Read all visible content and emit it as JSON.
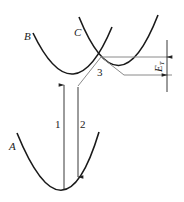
{
  "diagram": {
    "type": "configuration-coordinate",
    "curves": [
      {
        "id": "A",
        "label": "A"
      },
      {
        "id": "B",
        "label": "B"
      },
      {
        "id": "C",
        "label": "C"
      }
    ],
    "transitions": [
      {
        "id": "1",
        "label": "1",
        "direction": "up",
        "from": "A",
        "to": "B"
      },
      {
        "id": "2",
        "label": "2",
        "direction": "down",
        "from": "B",
        "to": "A"
      },
      {
        "id": "3",
        "label": "3",
        "description": "crossing of B and C"
      }
    ],
    "energy_gap": {
      "label": "E",
      "subscript": "T"
    },
    "colors": {
      "curve": "#1a1a1a",
      "guide": "#8a8a8a",
      "arrow": "#222222"
    }
  }
}
